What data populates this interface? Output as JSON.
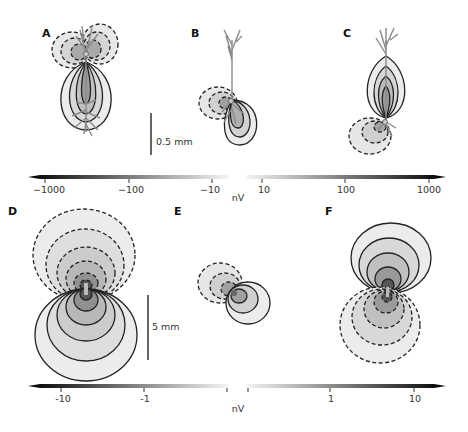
{
  "figure": {
    "panels": [
      {
        "id": "A",
        "label": "A",
        "pattern": "vertical dipole, negative (dashed) lobes upper-left/right, positive (solid) lobe below; neuron morphology overlay"
      },
      {
        "id": "B",
        "label": "B",
        "pattern": "tilted dipole, negative lobe left, positive lobe lower-right; neuron morphology overlay"
      },
      {
        "id": "C",
        "label": "C",
        "pattern": "positive lobe above, negative lobe lower-left; neuron morphology overlay"
      },
      {
        "id": "D",
        "label": "D",
        "pattern": "large vertical dipole, negative above, positive below"
      },
      {
        "id": "E",
        "label": "E",
        "pattern": "small tilted dipole, negative upper-left, positive lower-right"
      },
      {
        "id": "F",
        "label": "F",
        "pattern": "dipole, positive above, negative below"
      }
    ],
    "scalebars": {
      "top": {
        "label": "0.5 mm"
      },
      "bottom": {
        "label": "5 mm"
      }
    },
    "colorbars": {
      "top": {
        "ticks": [
          "−1000",
          "−100",
          "−10",
          "10",
          "100",
          "1000"
        ],
        "unit": "nV"
      },
      "bottom": {
        "ticks": [
          "-10",
          "-1",
          "1",
          "10"
        ],
        "unit": "nV"
      }
    },
    "legend": {
      "dashed": "negative potential",
      "solid": "positive potential"
    }
  }
}
